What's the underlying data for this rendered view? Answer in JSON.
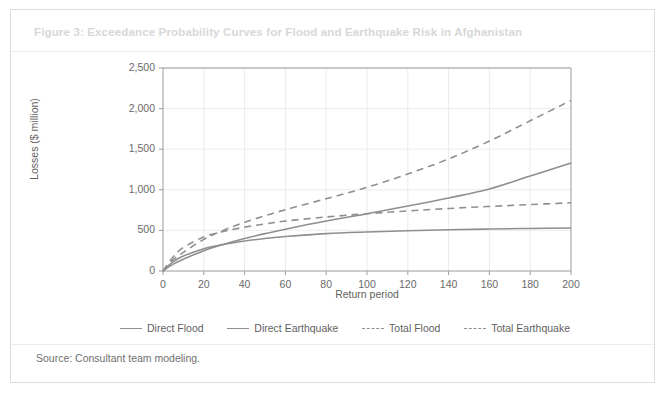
{
  "figure": {
    "title": "Figure 3: Exceedance Probability Curves for Flood and Earthquake Risk in Afghanistan",
    "source": "Source: Consultant team modeling.",
    "title_color": "#d7d7d7",
    "border_color": "#dcdcdc"
  },
  "chart_data": {
    "type": "line",
    "title": "Figure 3: Exceedance Probability Curves for Flood and Earthquake Risk in Afghanistan",
    "xlabel": "Return period",
    "ylabel": "Losses ($ million)",
    "xlim": [
      0,
      200
    ],
    "ylim": [
      0,
      2500
    ],
    "xticks": [
      0,
      20,
      40,
      60,
      80,
      100,
      120,
      140,
      160,
      180,
      200
    ],
    "xtick_labels": [
      "0",
      "20",
      "40",
      "60",
      "80",
      "100",
      "120",
      "140",
      "160",
      "180",
      "200"
    ],
    "yticks": [
      0,
      500,
      1000,
      1500,
      2000,
      2500
    ],
    "ytick_labels": [
      "0",
      "500",
      "1,000",
      "1,500",
      "2,000",
      "2,500"
    ],
    "grid": true,
    "grid_color": "#ececec",
    "legend_position": "below",
    "line_color": "#8f8f8f",
    "x": [
      0,
      5,
      10,
      20,
      30,
      40,
      50,
      60,
      80,
      100,
      120,
      140,
      160,
      180,
      200
    ],
    "series": [
      {
        "name": "Direct Flood",
        "style": "solid",
        "color": "#8f8f8f",
        "values": [
          0,
          115,
          185,
          275,
          330,
          370,
          400,
          425,
          460,
          480,
          495,
          508,
          517,
          524,
          530
        ]
      },
      {
        "name": "Direct Earthquake",
        "style": "solid",
        "color": "#8f8f8f",
        "values": [
          0,
          85,
          145,
          250,
          330,
          400,
          460,
          515,
          615,
          705,
          800,
          900,
          1010,
          1170,
          1330
        ]
      },
      {
        "name": "Total Flood",
        "style": "dashed",
        "color": "#8f8f8f",
        "values": [
          0,
          175,
          290,
          420,
          490,
          540,
          580,
          615,
          665,
          705,
          740,
          770,
          795,
          818,
          840
        ]
      },
      {
        "name": "Total Earthquake",
        "style": "dashed",
        "color": "#8f8f8f",
        "values": [
          0,
          140,
          230,
          390,
          505,
          600,
          680,
          755,
          890,
          1030,
          1195,
          1380,
          1600,
          1850,
          2100
        ]
      }
    ]
  }
}
